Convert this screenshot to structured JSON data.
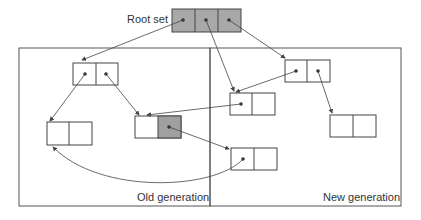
{
  "diagram": {
    "root_label": "Root set",
    "old_label": "Old generation",
    "new_label": "New generation",
    "colors": {
      "stroke": "#444444",
      "root_fill": "#a8a8a8",
      "shaded_cell": "#a0a0a0",
      "background": "#ffffff"
    },
    "nodes": [
      {
        "id": "root",
        "region": "root",
        "cells": 3
      },
      {
        "id": "A",
        "region": "old",
        "cells": 2
      },
      {
        "id": "B",
        "region": "old",
        "cells": 2
      },
      {
        "id": "C",
        "region": "old",
        "cells": 2,
        "shaded_cell": 2
      },
      {
        "id": "D",
        "region": "new",
        "cells": 2
      },
      {
        "id": "E",
        "region": "new",
        "cells": 2
      },
      {
        "id": "F",
        "region": "new",
        "cells": 2
      },
      {
        "id": "G",
        "region": "new",
        "cells": 2
      }
    ],
    "edges": [
      {
        "from": "root.1",
        "to": "A"
      },
      {
        "from": "root.2",
        "to": "E"
      },
      {
        "from": "root.3",
        "to": "D"
      },
      {
        "from": "A.1",
        "to": "B"
      },
      {
        "from": "A.2",
        "to": "C"
      },
      {
        "from": "D.1",
        "to": "E"
      },
      {
        "from": "D.2",
        "to": "F"
      },
      {
        "from": "E.1",
        "to": "C"
      },
      {
        "from": "C.2",
        "to": "G"
      },
      {
        "from": "G.1",
        "to": "B"
      }
    ]
  }
}
